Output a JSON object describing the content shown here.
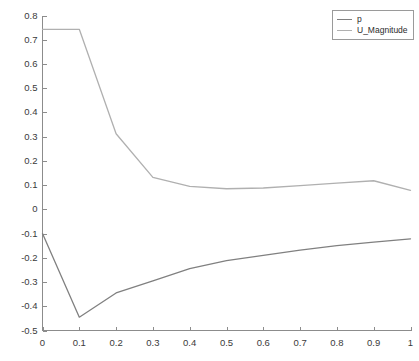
{
  "chart_data": {
    "type": "line",
    "title": "",
    "subtitle": "",
    "xlabel": "",
    "ylabel": "",
    "xlim": [
      0,
      1
    ],
    "ylim": [
      -0.5,
      0.8
    ],
    "grid": false,
    "legend_position": "top-right",
    "background_color": "#ffffff",
    "axis_color": "#8c8c8c",
    "x_ticks": [
      0,
      0.1,
      0.2,
      0.3,
      0.4,
      0.5,
      0.6,
      0.7,
      0.8,
      0.9,
      1
    ],
    "x_tick_labels": [
      "0",
      "0.1",
      "0.2",
      "0.3",
      "0.4",
      "0.5",
      "0.6",
      "0.7",
      "0.8",
      "0.9",
      "1"
    ],
    "y_ticks": [
      0.8,
      0.7,
      0.6,
      0.5,
      0.4,
      0.3,
      0.2,
      0.1,
      0,
      -0.1,
      -0.2,
      -0.3,
      -0.4,
      -0.5
    ],
    "y_tick_labels": [
      "0.8",
      "0.7",
      "0.6",
      "0.5",
      "0.4",
      "0.3",
      "0.2",
      "0.1",
      "0",
      "-0.1",
      "-0.2",
      "-0.3",
      "-0.4",
      "-0.5"
    ],
    "x": [
      0,
      0.1,
      0.2,
      0.3,
      0.4,
      0.5,
      0.6,
      0.7,
      0.8,
      0.9,
      1
    ],
    "series": [
      {
        "name": "p",
        "color": "#808080",
        "values": [
          -0.1,
          -0.445,
          -0.345,
          -0.295,
          -0.245,
          -0.212,
          -0.19,
          -0.168,
          -0.15,
          -0.135,
          -0.122
        ]
      },
      {
        "name": "U_Magnitude",
        "color": "#b0b0b0",
        "values": [
          0.743,
          0.743,
          0.312,
          0.132,
          0.095,
          0.085,
          0.088,
          0.098,
          0.108,
          0.118,
          0.078
        ]
      }
    ]
  },
  "legend": {
    "entries": [
      {
        "label": "p",
        "color": "#808080"
      },
      {
        "label": "U_Magnitude",
        "color": "#b0b0b0"
      }
    ]
  }
}
